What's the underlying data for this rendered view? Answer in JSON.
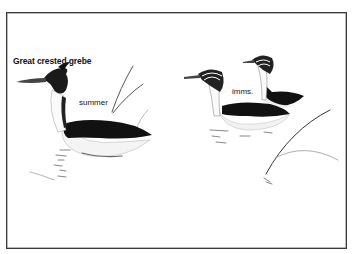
{
  "plate": {
    "title": "Great crested grebe",
    "labels": {
      "summer": "summer",
      "immatures": "imms."
    },
    "figures": [
      {
        "name": "adult-summer",
        "label_ref": "summer"
      },
      {
        "name": "immature-front",
        "label_ref": "immatures"
      },
      {
        "name": "immature-back",
        "label_ref": "immatures"
      }
    ],
    "colors": {
      "ink": "#111111",
      "frame": "#3a3a3a",
      "background": "#ffffff"
    }
  }
}
